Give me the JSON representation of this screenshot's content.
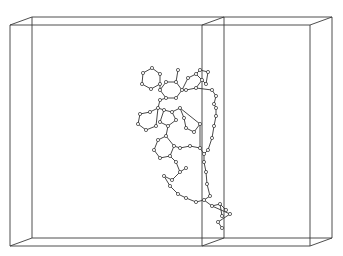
{
  "scene": {
    "type": "molecular-simulation-cell",
    "description": "Ball-and-stick molecule inside two adjacent periodic simulation boxes (wireframe)",
    "colors": {
      "background": "#ffffff",
      "line": "#333333",
      "atom_fill": "#ffffff"
    },
    "box": {
      "front": {
        "left": 10,
        "right": 310,
        "top": 25,
        "bottom": 246,
        "divider": 202
      },
      "back_offset": {
        "dx": 22,
        "dy": -8
      }
    },
    "molecule": {
      "atoms": [
        [
          143,
          73
        ],
        [
          152,
          68
        ],
        [
          160,
          74
        ],
        [
          160,
          84
        ],
        [
          151,
          89
        ],
        [
          142,
          84
        ],
        [
          160,
          90
        ],
        [
          166,
          82
        ],
        [
          176,
          82
        ],
        [
          182,
          90
        ],
        [
          176,
          98
        ],
        [
          166,
          98
        ],
        [
          178,
          70
        ],
        [
          188,
          78
        ],
        [
          196,
          74
        ],
        [
          202,
          80
        ],
        [
          196,
          88
        ],
        [
          186,
          90
        ],
        [
          200,
          70
        ],
        [
          208,
          72
        ],
        [
          206,
          84
        ],
        [
          212,
          90
        ],
        [
          216,
          96
        ],
        [
          214,
          104
        ],
        [
          160,
          100
        ],
        [
          158,
          108
        ],
        [
          150,
          112
        ],
        [
          140,
          114
        ],
        [
          138,
          124
        ],
        [
          146,
          130
        ],
        [
          156,
          126
        ],
        [
          164,
          110
        ],
        [
          172,
          112
        ],
        [
          176,
          120
        ],
        [
          168,
          126
        ],
        [
          160,
          122
        ],
        [
          180,
          108
        ],
        [
          184,
          118
        ],
        [
          186,
          128
        ],
        [
          194,
          132
        ],
        [
          200,
          124
        ],
        [
          158,
          140
        ],
        [
          154,
          150
        ],
        [
          160,
          158
        ],
        [
          170,
          156
        ],
        [
          174,
          146
        ],
        [
          166,
          136
        ],
        [
          180,
          148
        ],
        [
          190,
          146
        ],
        [
          200,
          148
        ],
        [
          204,
          154
        ],
        [
          176,
          162
        ],
        [
          180,
          172
        ],
        [
          172,
          180
        ],
        [
          186,
          168
        ],
        [
          164,
          176
        ],
        [
          170,
          186
        ],
        [
          178,
          194
        ],
        [
          186,
          198
        ],
        [
          196,
          202
        ],
        [
          204,
          200
        ],
        [
          212,
          206
        ],
        [
          220,
          204
        ],
        [
          226,
          210
        ],
        [
          222,
          216
        ],
        [
          230,
          214
        ],
        [
          218,
          222
        ],
        [
          222,
          228
        ],
        [
          210,
          196
        ],
        [
          207,
          184
        ],
        [
          206,
          172
        ],
        [
          204,
          162
        ],
        [
          208,
          150
        ],
        [
          212,
          138
        ],
        [
          214,
          126
        ],
        [
          216,
          116
        ],
        [
          216,
          108
        ]
      ],
      "bonds": [
        [
          0,
          1
        ],
        [
          1,
          2
        ],
        [
          2,
          3
        ],
        [
          3,
          4
        ],
        [
          4,
          5
        ],
        [
          5,
          0
        ],
        [
          3,
          6
        ],
        [
          6,
          7
        ],
        [
          7,
          8
        ],
        [
          8,
          9
        ],
        [
          9,
          10
        ],
        [
          10,
          11
        ],
        [
          11,
          6
        ],
        [
          8,
          12
        ],
        [
          9,
          13
        ],
        [
          13,
          14
        ],
        [
          14,
          15
        ],
        [
          15,
          16
        ],
        [
          16,
          17
        ],
        [
          17,
          9
        ],
        [
          14,
          18
        ],
        [
          18,
          19
        ],
        [
          19,
          20
        ],
        [
          20,
          15
        ],
        [
          16,
          21
        ],
        [
          21,
          22
        ],
        [
          22,
          23
        ],
        [
          11,
          24
        ],
        [
          24,
          25
        ],
        [
          25,
          26
        ],
        [
          26,
          27
        ],
        [
          27,
          28
        ],
        [
          28,
          29
        ],
        [
          29,
          30
        ],
        [
          30,
          25
        ],
        [
          25,
          31
        ],
        [
          31,
          32
        ],
        [
          32,
          33
        ],
        [
          33,
          34
        ],
        [
          34,
          35
        ],
        [
          35,
          31
        ],
        [
          32,
          36
        ],
        [
          36,
          37
        ],
        [
          37,
          38
        ],
        [
          38,
          39
        ],
        [
          39,
          40
        ],
        [
          40,
          36
        ],
        [
          34,
          46
        ],
        [
          46,
          41
        ],
        [
          41,
          42
        ],
        [
          42,
          43
        ],
        [
          43,
          44
        ],
        [
          44,
          45
        ],
        [
          45,
          46
        ],
        [
          45,
          47
        ],
        [
          47,
          48
        ],
        [
          48,
          49
        ],
        [
          49,
          50
        ],
        [
          40,
          49
        ],
        [
          44,
          51
        ],
        [
          51,
          52
        ],
        [
          52,
          53
        ],
        [
          52,
          54
        ],
        [
          53,
          55
        ],
        [
          55,
          56
        ],
        [
          56,
          57
        ],
        [
          57,
          58
        ],
        [
          58,
          59
        ],
        [
          59,
          60
        ],
        [
          60,
          61
        ],
        [
          61,
          62
        ],
        [
          62,
          63
        ],
        [
          62,
          64
        ],
        [
          61,
          65
        ],
        [
          65,
          66
        ],
        [
          66,
          67
        ],
        [
          60,
          68
        ],
        [
          68,
          69
        ],
        [
          69,
          70
        ],
        [
          70,
          71
        ],
        [
          71,
          50
        ],
        [
          50,
          72
        ],
        [
          72,
          73
        ],
        [
          73,
          74
        ],
        [
          74,
          75
        ],
        [
          75,
          76
        ],
        [
          76,
          23
        ]
      ]
    }
  }
}
